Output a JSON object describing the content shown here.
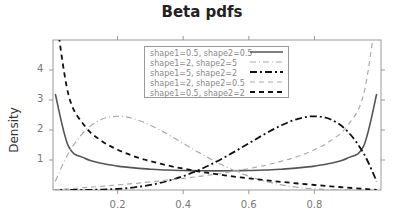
{
  "chart_data": {
    "type": "line",
    "title": "Beta pdfs",
    "xlabel": "",
    "ylabel": "Density",
    "xlim": [
      0,
      1
    ],
    "ylim": [
      0,
      5
    ],
    "x_ticks": [
      "0.2",
      "0.4",
      "0.6",
      "0.8"
    ],
    "y_ticks": [
      "1",
      "2",
      "3",
      "4"
    ],
    "grid": false,
    "legend_position": "top-center",
    "x": [
      0.01,
      0.05,
      0.1,
      0.15,
      0.2,
      0.25,
      0.3,
      0.35,
      0.4,
      0.45,
      0.5,
      0.55,
      0.6,
      0.65,
      0.7,
      0.75,
      0.8,
      0.85,
      0.9,
      0.95,
      0.99
    ],
    "series": [
      {
        "name": "shape1=0.5, shape2=0.5",
        "style": "solid",
        "color": "#555555",
        "values": [
          3.199,
          1.461,
          1.061,
          0.891,
          0.796,
          0.735,
          0.695,
          0.667,
          0.65,
          0.64,
          0.637,
          0.64,
          0.65,
          0.667,
          0.695,
          0.735,
          0.796,
          0.891,
          1.061,
          1.461,
          3.199
        ]
      },
      {
        "name": "shape1=2, shape2=5",
        "style": "dashdot-light",
        "color": "#aaaaaa",
        "values": [
          0.288,
          1.222,
          1.968,
          2.349,
          2.458,
          2.373,
          2.161,
          1.874,
          1.555,
          1.235,
          0.938,
          0.677,
          0.461,
          0.293,
          0.17,
          0.088,
          0.038,
          0.014,
          0.003,
          0.0002,
          0
        ]
      },
      {
        "name": "shape1=5, shape2=2",
        "style": "dashdot",
        "color": "#111111",
        "values": [
          0,
          0.0002,
          0.003,
          0.014,
          0.038,
          0.088,
          0.17,
          0.293,
          0.461,
          0.677,
          0.938,
          1.235,
          1.555,
          1.874,
          2.161,
          2.373,
          2.458,
          2.349,
          1.968,
          1.222,
          0.288
        ]
      },
      {
        "name": "shape1=2, shape2=0.5",
        "style": "dashed-light",
        "color": "#aaaaaa",
        "values": [
          0.0075,
          0.0385,
          0.079,
          0.122,
          0.168,
          0.217,
          0.269,
          0.326,
          0.387,
          0.455,
          0.53,
          0.615,
          0.712,
          0.824,
          0.959,
          1.125,
          1.342,
          1.646,
          2.134,
          3.186,
          7.425
        ]
      },
      {
        "name": "shape1=0.5, shape2=2",
        "style": "dashed",
        "color": "#111111",
        "values": [
          7.425,
          3.186,
          2.134,
          1.646,
          1.342,
          1.125,
          0.959,
          0.824,
          0.712,
          0.615,
          0.53,
          0.455,
          0.387,
          0.326,
          0.269,
          0.217,
          0.168,
          0.122,
          0.079,
          0.0385,
          0.0075
        ]
      }
    ]
  }
}
